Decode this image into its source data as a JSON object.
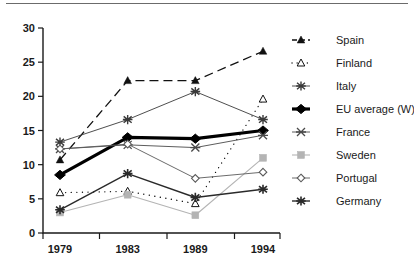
{
  "chart_data": {
    "type": "line",
    "title": "",
    "xlabel": "",
    "ylabel": "",
    "categories": [
      "1979",
      "1983",
      "1989",
      "1994"
    ],
    "ylim": [
      0,
      30
    ],
    "yticks": [
      0,
      5,
      10,
      15,
      20,
      25,
      30
    ],
    "ytick_labels": [
      "0",
      "5",
      "10",
      "15",
      "20",
      "25",
      "30"
    ],
    "xtick_labels": [
      "1979",
      "1983",
      "1989",
      "1994"
    ],
    "grid": false,
    "legend_position": "right",
    "series": [
      {
        "name": "Spain",
        "values": [
          10.7,
          22.3,
          22.3,
          26.6
        ],
        "marker": "filled-triangle",
        "line_style": "dashed",
        "color": "#111111",
        "line_width": 1.3
      },
      {
        "name": "Finland",
        "values": [
          5.9,
          6.1,
          4.3,
          19.6
        ],
        "marker": "open-triangle",
        "line_style": "dotted",
        "color": "#111111",
        "line_width": 1.3
      },
      {
        "name": "Italy",
        "values": [
          13.3,
          16.6,
          20.7,
          16.6
        ],
        "marker": "asterisk",
        "line_style": "solid",
        "color": "#3a3a3a",
        "line_width": 0.9
      },
      {
        "name": "EU average (W)",
        "values": [
          8.5,
          14.0,
          13.8,
          15.0
        ],
        "marker": "filled-diamond",
        "line_style": "solid",
        "color": "#000000",
        "line_width": 3.2
      },
      {
        "name": "France",
        "values": [
          12.3,
          12.9,
          12.5,
          14.3
        ],
        "marker": "x-cross",
        "line_style": "solid",
        "color": "#4a4a4a",
        "line_width": 0.9
      },
      {
        "name": "Sweden",
        "values": [
          3.0,
          5.6,
          2.6,
          11.0
        ],
        "marker": "filled-square",
        "line_style": "solid",
        "color": "#b4b4b4",
        "line_width": 1.1
      },
      {
        "name": "Portugal",
        "values": [
          12.3,
          13.0,
          8.0,
          8.9
        ],
        "marker": "open-diamond",
        "line_style": "solid",
        "color": "#5a5a5a",
        "line_width": 0.9
      },
      {
        "name": "Germany",
        "values": [
          3.4,
          8.7,
          5.2,
          6.4
        ],
        "marker": "star-asterisk",
        "line_style": "solid",
        "color": "#2a2a2a",
        "line_width": 1.4
      }
    ]
  },
  "legend": {
    "items": [
      {
        "label": "Spain"
      },
      {
        "label": "Finland"
      },
      {
        "label": "Italy"
      },
      {
        "label": "EU average (W)"
      },
      {
        "label": "France"
      },
      {
        "label": "Sweden"
      },
      {
        "label": "Portugal"
      },
      {
        "label": "Germany"
      }
    ]
  }
}
